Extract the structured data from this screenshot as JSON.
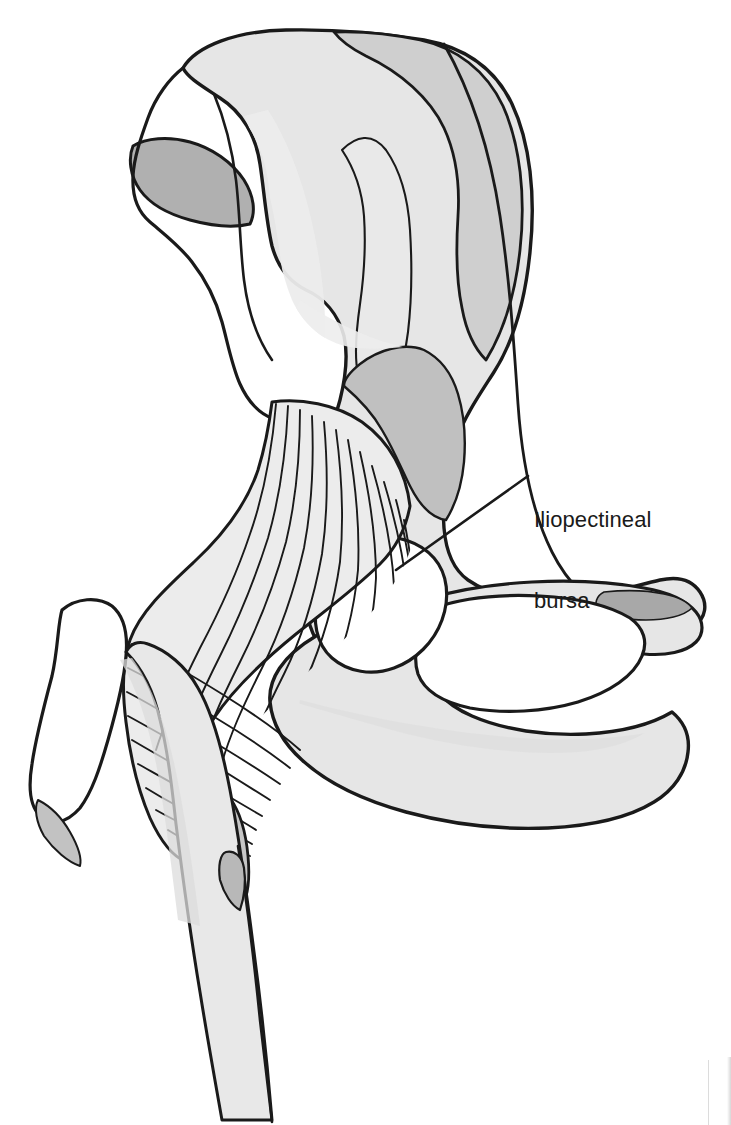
{
  "figure": {
    "kind": "anatomical-line-drawing",
    "background_color": "#ffffff",
    "ink_color": "#1a1a1a",
    "fills": {
      "bone_light": "#e6e6e6",
      "bone_mid": "#cfcfcf",
      "bone_dark": "#b0b0b0",
      "cartilage_dark": "#a8a8a8",
      "open_white": "#ffffff"
    },
    "stroke_widths": {
      "outline": 3.4,
      "inner_contour": 2.4,
      "muscle_fiber": 1.9,
      "leader": 2.6
    }
  },
  "annotations": [
    {
      "id": "iliopectineal-bursa",
      "label_line_1": "Iliopectineal",
      "label_line_2": "bursa",
      "label_x": 534,
      "label_y": 452,
      "leader_from": [
        528,
        476
      ],
      "leader_to": [
        396,
        570
      ]
    }
  ],
  "structures": [
    {
      "name": "iliac-crest",
      "fill": "bone_mid"
    },
    {
      "name": "iliac-fossa",
      "fill": "bone_light"
    },
    {
      "name": "anterior-superior-iliac-spine",
      "fill": "bone_dark"
    },
    {
      "name": "ilium-body",
      "fill": "bone_light"
    },
    {
      "name": "superior-pubic-ramus",
      "fill": "bone_light"
    },
    {
      "name": "pubic-symphysis-surface",
      "fill": "cartilage_dark"
    },
    {
      "name": "inferior-pubic-ramus",
      "fill": "bone_light"
    },
    {
      "name": "ischium",
      "fill": "bone_light"
    },
    {
      "name": "obturator-foramen",
      "fill": "open_white"
    },
    {
      "name": "iliopectineal-bursa",
      "fill": "open_white"
    },
    {
      "name": "iliopsoas-muscle",
      "fill": "bone_light"
    },
    {
      "name": "psoas-tendon-insertion",
      "fill": "bone_dark"
    },
    {
      "name": "greater-trochanter",
      "fill": "open_white"
    },
    {
      "name": "femoral-neck",
      "fill": "bone_light"
    },
    {
      "name": "femoral-shaft",
      "fill": "bone_light"
    },
    {
      "name": "lesser-trochanter",
      "fill": "bone_dark"
    }
  ],
  "page_artifact": {
    "name": "scan-page-edge",
    "color": "#dcdcdc"
  }
}
